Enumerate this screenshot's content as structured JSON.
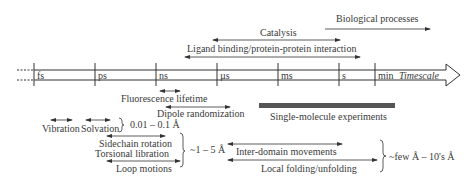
{
  "timeline": {
    "ticks": [
      "fs",
      "ps",
      "ns",
      "µs",
      "ms",
      "s",
      "min"
    ],
    "axis_label": "Timescale"
  },
  "processes_above": {
    "biological": "Biological processes",
    "catalysis": "Catalysis",
    "ligand": "Ligand binding/protein-protein interaction"
  },
  "techniques": {
    "fluorescence": "Fluorescence lifetime",
    "dipole": "Dipole randomization",
    "single_molecule": "Single-molecule experiments"
  },
  "motions": {
    "vibration": "Vibration",
    "solvation": "Solvation",
    "range_small": "0.01 – 0.1 Å",
    "sidechain": "Sidechain rotation",
    "torsional": "Torsional libration",
    "loop": "Loop motions",
    "range_medium": "~1 – 5 Å",
    "interdomain": "Inter-domain movements",
    "local_folding": "Local folding/unfolding",
    "range_large": "~few Å – 10's Å"
  },
  "colors": {
    "line": "#333333",
    "bar": "#555555"
  }
}
